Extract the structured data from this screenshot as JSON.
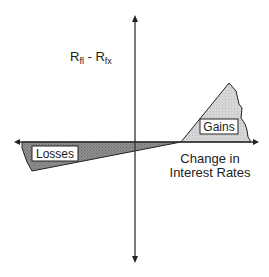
{
  "diagram": {
    "y_axis_label": {
      "main1": "R",
      "sub1": "fl",
      "sep": " - ",
      "main2": "R",
      "sub2": "fx"
    },
    "x_axis_label": {
      "line1": "Change in",
      "line2": "Interest Rates"
    },
    "regions": {
      "gains": {
        "label": "Gains",
        "fill": "#d4d4d4"
      },
      "losses": {
        "label": "Losses",
        "fill": "#8a8a8a"
      }
    },
    "colors": {
      "axis": "#333333",
      "outline": "#222222"
    }
  }
}
